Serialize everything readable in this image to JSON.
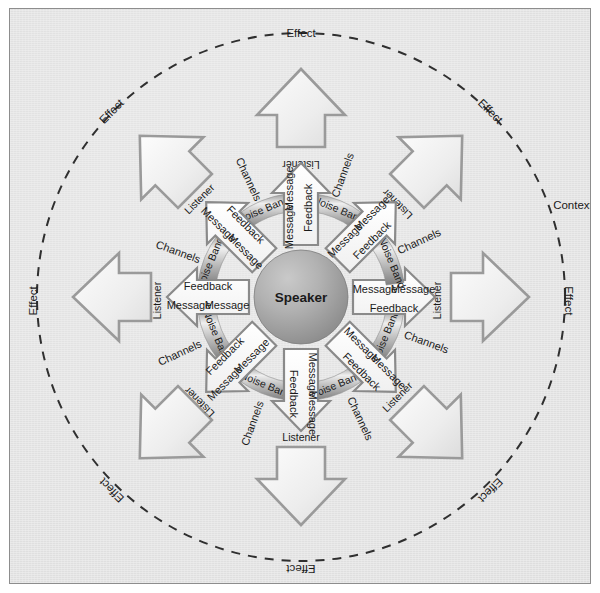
{
  "diagram": {
    "title_center": "Speaker",
    "outer_context_label": "Context",
    "ring_label": "Noise Band",
    "channels_label": "Channels",
    "listener_label": "Listener",
    "effect_label": "Effect",
    "message_label": "Message",
    "feedback_label": "Feedback",
    "spokes": [
      {
        "angle": 0,
        "listener": "Listener",
        "channels": "Channels",
        "effect": "Effect",
        "noise_band": "Noise Band",
        "message_out": "Message",
        "message_in": "Message",
        "feedback": "Feedback"
      },
      {
        "angle": 45,
        "listener": "Listener",
        "channels": "Channels",
        "effect": "Effect",
        "noise_band": "Noise Band",
        "message_out": "Message",
        "message_in": "Message",
        "feedback": "Feedback"
      },
      {
        "angle": 90,
        "listener": "Listener",
        "channels": "Channels",
        "effect": "Effect",
        "noise_band": "Noise Band",
        "message_out": "Message",
        "message_in": "Message",
        "feedback": "Feedback"
      },
      {
        "angle": 135,
        "listener": "Listener",
        "channels": "Channels",
        "effect": "Effect",
        "noise_band": "Noise Band",
        "message_out": "Message",
        "message_in": "Message",
        "feedback": "Feedback"
      },
      {
        "angle": 180,
        "listener": "Listener",
        "channels": "Channels",
        "effect": "Effect",
        "noise_band": "Noise Band",
        "message_out": "Message",
        "message_in": "Message",
        "feedback": "Feedback"
      },
      {
        "angle": 225,
        "listener": "Listener",
        "channels": "Channels",
        "effect": "Effect",
        "noise_band": "Noise Band",
        "message_out": "Message",
        "message_in": "Message",
        "feedback": "Feedback"
      },
      {
        "angle": 270,
        "listener": "Listener",
        "channels": "Channels",
        "effect": "Effect",
        "noise_band": "Noise Band",
        "message_out": "Message",
        "message_in": "Message",
        "feedback": "Feedback"
      },
      {
        "angle": 315,
        "listener": "Listener",
        "channels": "Channels",
        "effect": "Effect",
        "noise_band": "Noise Band",
        "message_out": "Message",
        "message_in": "Message",
        "feedback": "Feedback"
      }
    ],
    "colors": {
      "background": "#e2e2e2",
      "frame_border": "#8d8d8d",
      "sphere_light": "#bdbdbd",
      "sphere_dark": "#8f8f8f",
      "ring_light": "#e8e8e8",
      "ring_dark": "#8a8a8a",
      "arrow_fill": "#f2f2f2",
      "arrow_stroke": "#9a9a9a",
      "text": "#1a1a1a",
      "dash_circle": "#2f2f2f"
    },
    "geometry": {
      "center_x": 291,
      "center_y": 288,
      "sphere_radius": 47,
      "ring_inner_radius": 86,
      "ring_outer_radius": 104,
      "dashed_circle_radius": 264,
      "spoke_count": 8
    }
  }
}
